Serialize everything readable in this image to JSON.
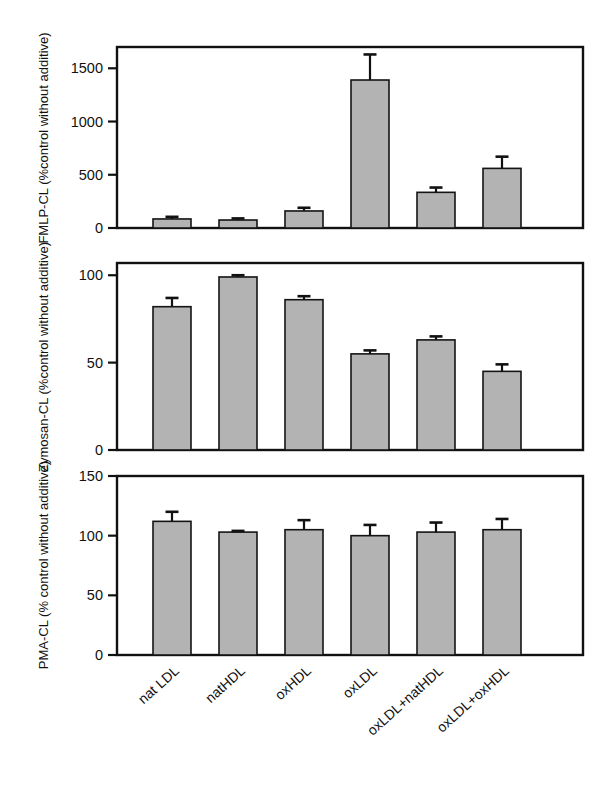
{
  "figure": {
    "title": "",
    "background_color": "#ffffff",
    "bar_fill_color": "#b3b3b3",
    "bar_edge_color": "#141414",
    "axis_color": "#111111"
  },
  "categories": [
    "nat LDL",
    "natHDL",
    "oxHDL",
    "oxLDL",
    "oxLDL+natHDL",
    "oxLDL+oxHDL"
  ],
  "chart_data": [
    {
      "type": "bar",
      "panel": "top",
      "title": "",
      "xlabel": "",
      "ylabel": "FMLP-CL (%control without additive)",
      "categories": [
        "nat LDL",
        "natHDL",
        "oxHDL",
        "oxLDL",
        "oxLDL+natHDL",
        "oxLDL+oxHDL"
      ],
      "values": [
        85,
        75,
        160,
        1390,
        335,
        560
      ],
      "errors": [
        20,
        15,
        30,
        240,
        45,
        110
      ],
      "ylim": [
        0,
        1700
      ],
      "yticks": [
        0,
        500,
        1000,
        1500
      ],
      "ytick_labels": [
        "0",
        "500",
        "1000",
        "1500"
      ],
      "grid": false,
      "legend": "none"
    },
    {
      "type": "bar",
      "panel": "middle",
      "title": "",
      "xlabel": "",
      "ylabel": "Zymosan-CL (%control without additive)",
      "categories": [
        "nat LDL",
        "natHDL",
        "oxHDL",
        "oxLDL",
        "oxLDL+natHDL",
        "oxLDL+oxHDL"
      ],
      "values": [
        82,
        99,
        86,
        55,
        63,
        45
      ],
      "errors": [
        5,
        1,
        2,
        2,
        2,
        4
      ],
      "ylim": [
        0,
        107
      ],
      "yticks": [
        0,
        50,
        100
      ],
      "ytick_labels": [
        "0",
        "50",
        "100"
      ],
      "grid": false,
      "legend": "none"
    },
    {
      "type": "bar",
      "panel": "bottom",
      "title": "",
      "xlabel": "",
      "ylabel": "PMA-CL (% control without additive)",
      "categories": [
        "nat LDL",
        "natHDL",
        "oxHDL",
        "oxLDL",
        "oxLDL+natHDL",
        "oxLDL+oxHDL"
      ],
      "values": [
        112,
        103,
        105,
        100,
        103,
        105
      ],
      "errors": [
        8,
        1,
        8,
        9,
        8,
        9
      ],
      "ylim": [
        0,
        150
      ],
      "yticks": [
        0,
        50,
        100,
        150
      ],
      "ytick_labels": [
        "0",
        "50",
        "100",
        "150"
      ],
      "grid": false,
      "legend": "none"
    }
  ]
}
